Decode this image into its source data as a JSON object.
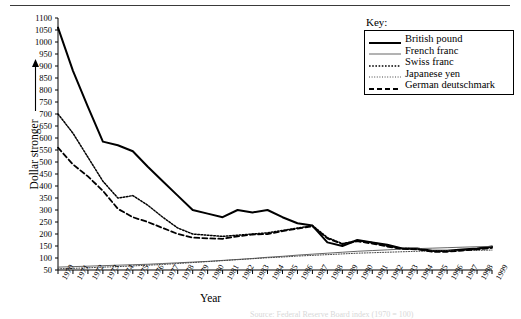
{
  "figure": {
    "y_axis_title": "Dollar stronger",
    "y_axis_arrow": "↑",
    "x_axis_title": "Year",
    "caption_faint": "Source: Federal Reserve Board index (1970 = 100)"
  },
  "legend": {
    "title": "Key:",
    "entries": [
      {
        "label": "British pound",
        "style": "thick-solid",
        "color": "#000000"
      },
      {
        "label": "French franc",
        "style": "thin-solid",
        "color": "#555555"
      },
      {
        "label": "Swiss franc",
        "style": "dotted",
        "color": "#000000"
      },
      {
        "label": "Japanese yen",
        "style": "fine-dotted",
        "color": "#444444"
      },
      {
        "label": "German deutschmark",
        "style": "dashed",
        "color": "#000000"
      }
    ]
  },
  "chart_data": {
    "type": "line",
    "title": "",
    "xlabel": "Year",
    "ylabel": "Dollar stronger",
    "xlim": [
      1970,
      1999
    ],
    "ylim": [
      50,
      1100
    ],
    "ytick_step": 50,
    "grid": false,
    "legend_position": "top-right",
    "x": [
      1970,
      1971,
      1972,
      1973,
      1974,
      1975,
      1976,
      1977,
      1978,
      1979,
      1980,
      1981,
      1982,
      1983,
      1984,
      1985,
      1986,
      1987,
      1988,
      1989,
      1990,
      1991,
      1992,
      1993,
      1994,
      1995,
      1996,
      1997,
      1998,
      1999
    ],
    "yticks": [
      50,
      100,
      150,
      200,
      250,
      300,
      350,
      400,
      450,
      500,
      550,
      600,
      650,
      700,
      750,
      800,
      850,
      900,
      950,
      1000,
      1050,
      1100
    ],
    "xticks": [
      "1970",
      "1971",
      "1972",
      "1973",
      "1974",
      "1975",
      "1976",
      "1977",
      "1978",
      "1979",
      "1980",
      "1981",
      "1982",
      "1983",
      "1984",
      "1985",
      "1986",
      "1987",
      "1988",
      "1989",
      "1990",
      "1991",
      "1992",
      "1993",
      "1994",
      "1995",
      "1996",
      "1997",
      "1998",
      "1999"
    ],
    "series": [
      {
        "name": "British pound",
        "style": "thick-solid",
        "color": "#000000",
        "values": [
          1060,
          880,
          730,
          585,
          570,
          545,
          480,
          420,
          360,
          300,
          285,
          270,
          300,
          290,
          300,
          270,
          245,
          235,
          165,
          150,
          175,
          165,
          155,
          140,
          140,
          130,
          130,
          135,
          140,
          148
        ]
      },
      {
        "name": "French franc",
        "style": "thin-solid",
        "color": "#555555",
        "values": [
          62,
          64,
          66,
          68,
          70,
          72,
          74,
          77,
          80,
          83,
          86,
          90,
          94,
          98,
          103,
          107,
          112,
          116,
          120,
          124,
          128,
          131,
          134,
          137,
          139,
          141,
          143,
          145,
          147,
          148
        ]
      },
      {
        "name": "Swiss franc",
        "style": "dotted",
        "color": "#000000",
        "values": [
          700,
          620,
          520,
          420,
          350,
          360,
          320,
          270,
          225,
          200,
          195,
          190,
          195,
          200,
          205,
          215,
          225,
          235,
          185,
          160,
          172,
          165,
          150,
          140,
          138,
          128,
          128,
          133,
          138,
          145
        ]
      },
      {
        "name": "Japanese yen",
        "style": "fine-dotted",
        "color": "#444444",
        "values": [
          55,
          57,
          59,
          62,
          64,
          67,
          70,
          73,
          77,
          81,
          85,
          89,
          93,
          97,
          101,
          104,
          108,
          111,
          114,
          117,
          120,
          122,
          124,
          126,
          128,
          129,
          130,
          131,
          132,
          133
        ]
      },
      {
        "name": "German deutschmark",
        "style": "dashed",
        "color": "#000000",
        "values": [
          560,
          490,
          440,
          380,
          305,
          270,
          250,
          225,
          200,
          185,
          182,
          180,
          190,
          198,
          200,
          212,
          222,
          232,
          182,
          158,
          170,
          160,
          148,
          138,
          136,
          126,
          126,
          131,
          136,
          142
        ]
      }
    ]
  }
}
